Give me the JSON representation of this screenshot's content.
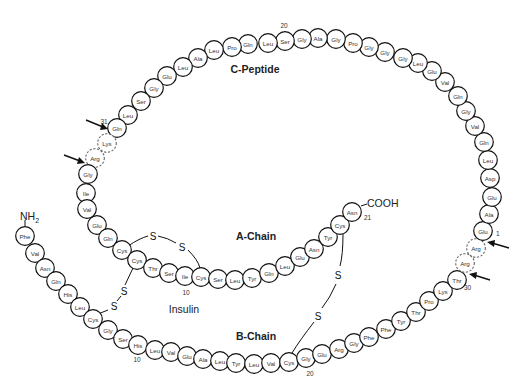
{
  "title": "Insulin",
  "labels": {
    "c_peptide": "C-Peptide",
    "a_chain": "A-Chain",
    "b_chain": "B-Chain",
    "insulin": "Insulin",
    "nh2": "NH",
    "nh2_sub": "2",
    "cooh": "COOH",
    "disulfide": "S"
  },
  "numbers": {
    "c20": "20",
    "c31": "31",
    "a1": "1",
    "a10": "10",
    "a21": "21",
    "b10": "10",
    "b20": "20",
    "b30": "30"
  },
  "b_chain": [
    {
      "aa": "Phe",
      "x": 25,
      "y": 236
    },
    {
      "aa": "Val",
      "x": 35,
      "y": 253
    },
    {
      "aa": "Asn",
      "x": 45,
      "y": 268
    },
    {
      "aa": "Gln",
      "x": 56,
      "y": 281
    },
    {
      "aa": "His",
      "x": 68,
      "y": 294
    },
    {
      "aa": "Leu",
      "x": 80,
      "y": 307
    },
    {
      "aa": "Cys",
      "x": 93,
      "y": 319
    },
    {
      "aa": "Gly",
      "x": 108,
      "y": 330
    },
    {
      "aa": "Ser",
      "x": 123,
      "y": 339
    },
    {
      "aa": "His",
      "x": 138,
      "y": 345
    },
    {
      "aa": "Leu",
      "x": 155,
      "y": 350
    },
    {
      "aa": "Val",
      "x": 171,
      "y": 352
    },
    {
      "aa": "Glu",
      "x": 187,
      "y": 356
    },
    {
      "aa": "Ala",
      "x": 203,
      "y": 359
    },
    {
      "aa": "Leu",
      "x": 220,
      "y": 361
    },
    {
      "aa": "Tyr",
      "x": 236,
      "y": 363
    },
    {
      "aa": "Leu",
      "x": 254,
      "y": 364
    },
    {
      "aa": "Val",
      "x": 271,
      "y": 363
    },
    {
      "aa": "Cys",
      "x": 289,
      "y": 362
    },
    {
      "aa": "Gly",
      "x": 306,
      "y": 358
    },
    {
      "aa": "Glu",
      "x": 322,
      "y": 354
    },
    {
      "aa": "Arg",
      "x": 339,
      "y": 349
    },
    {
      "aa": "Gly",
      "x": 354,
      "y": 343
    },
    {
      "aa": "Phe",
      "x": 369,
      "y": 337
    },
    {
      "aa": "Phe",
      "x": 386,
      "y": 329
    },
    {
      "aa": "Tyr",
      "x": 401,
      "y": 321
    },
    {
      "aa": "Thr",
      "x": 416,
      "y": 312
    },
    {
      "aa": "Pro",
      "x": 429,
      "y": 301
    },
    {
      "aa": "Lys",
      "x": 443,
      "y": 291
    },
    {
      "aa": "Thr",
      "x": 457,
      "y": 280
    }
  ],
  "cleavage_b_c": [
    {
      "aa": "Arg",
      "x": 465,
      "y": 263
    },
    {
      "aa": "Arg",
      "x": 476,
      "y": 248
    }
  ],
  "c_peptide": [
    {
      "aa": "Glu",
      "x": 483,
      "y": 231
    },
    {
      "aa": "Ala",
      "x": 489,
      "y": 214
    },
    {
      "aa": "Glu",
      "x": 492,
      "y": 197
    },
    {
      "aa": "Asp",
      "x": 490,
      "y": 178
    },
    {
      "aa": "Leu",
      "x": 488,
      "y": 160
    },
    {
      "aa": "Gln",
      "x": 484,
      "y": 142
    },
    {
      "aa": "Val",
      "x": 475,
      "y": 126
    },
    {
      "aa": "Gly",
      "x": 466,
      "y": 111
    },
    {
      "aa": "Gln",
      "x": 458,
      "y": 96
    },
    {
      "aa": "Val",
      "x": 445,
      "y": 82
    },
    {
      "aa": "Glu",
      "x": 432,
      "y": 71
    },
    {
      "aa": "Leu",
      "x": 418,
      "y": 63
    },
    {
      "aa": "Gly",
      "x": 403,
      "y": 58
    },
    {
      "aa": "Gly",
      "x": 385,
      "y": 52
    },
    {
      "aa": "Gly",
      "x": 369,
      "y": 47
    },
    {
      "aa": "Pro",
      "x": 353,
      "y": 43
    },
    {
      "aa": "Gly",
      "x": 336,
      "y": 39
    },
    {
      "aa": "Ala",
      "x": 318,
      "y": 38
    },
    {
      "aa": "Gly",
      "x": 302,
      "y": 39
    },
    {
      "aa": "Ser",
      "x": 285,
      "y": 41
    },
    {
      "aa": "Leu",
      "x": 268,
      "y": 43
    },
    {
      "aa": "Gln",
      "x": 248,
      "y": 44
    },
    {
      "aa": "Pro",
      "x": 232,
      "y": 47
    },
    {
      "aa": "Leu",
      "x": 214,
      "y": 50
    },
    {
      "aa": "Ala",
      "x": 198,
      "y": 58
    },
    {
      "aa": "Leu",
      "x": 183,
      "y": 67
    },
    {
      "aa": "Glu",
      "x": 167,
      "y": 76
    },
    {
      "aa": "Gly",
      "x": 154,
      "y": 88
    },
    {
      "aa": "Ser",
      "x": 141,
      "y": 101
    },
    {
      "aa": "Leu",
      "x": 128,
      "y": 115
    },
    {
      "aa": "Gln",
      "x": 117,
      "y": 128
    }
  ],
  "cleavage_c_a": [
    {
      "aa": "Lys",
      "x": 107,
      "y": 143
    },
    {
      "aa": "Arg",
      "x": 95,
      "y": 158
    }
  ],
  "a_chain": [
    {
      "aa": "Gly",
      "x": 88,
      "y": 174
    },
    {
      "aa": "Ile",
      "x": 86,
      "y": 193
    },
    {
      "aa": "Val",
      "x": 87,
      "y": 209
    },
    {
      "aa": "Glu",
      "x": 97,
      "y": 225
    },
    {
      "aa": "Gln",
      "x": 108,
      "y": 238
    },
    {
      "aa": "Cys",
      "x": 122,
      "y": 250
    },
    {
      "aa": "Cys",
      "x": 137,
      "y": 260
    },
    {
      "aa": "Thr",
      "x": 153,
      "y": 268
    },
    {
      "aa": "Ser",
      "x": 169,
      "y": 273
    },
    {
      "aa": "Ile",
      "x": 185,
      "y": 276
    },
    {
      "aa": "Cys",
      "x": 201,
      "y": 277
    },
    {
      "aa": "Ser",
      "x": 218,
      "y": 279
    },
    {
      "aa": "Leu",
      "x": 235,
      "y": 280
    },
    {
      "aa": "Tyr",
      "x": 252,
      "y": 278
    },
    {
      "aa": "Gln",
      "x": 269,
      "y": 273
    },
    {
      "aa": "Leu",
      "x": 285,
      "y": 266
    },
    {
      "aa": "Glu",
      "x": 300,
      "y": 257
    },
    {
      "aa": "Asn",
      "x": 314,
      "y": 249
    },
    {
      "aa": "Tyr",
      "x": 328,
      "y": 237
    },
    {
      "aa": "Cys",
      "x": 340,
      "y": 225
    },
    {
      "aa": "Asn",
      "x": 352,
      "y": 212
    }
  ]
}
